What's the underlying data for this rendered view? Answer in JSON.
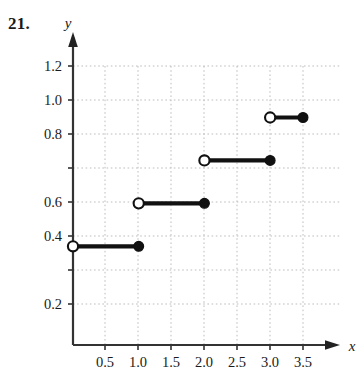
{
  "figure": {
    "problem_number": "21."
  },
  "chart_data": {
    "type": "line",
    "title": "",
    "subtitle": "",
    "xlabel": "x",
    "ylabel": "y",
    "grid": true,
    "legend": "none",
    "xlim": [
      0,
      3.75
    ],
    "ylim": [
      0,
      1.3
    ],
    "xticks": [
      0.5,
      1.0,
      1.5,
      2.0,
      2.5,
      3.0,
      3.5
    ],
    "xtick_labels": [
      "0.5",
      "1.0",
      "1.5",
      "2.0",
      "2.5",
      "3.0",
      "3.5"
    ],
    "yticks": [
      0.2,
      0.4,
      0.6,
      0.8,
      1.0,
      1.2
    ],
    "ytick_labels": [
      "0.2",
      "0.4",
      "0.6",
      "0.8",
      "1.0",
      "1.2"
    ],
    "segments": [
      {
        "x_start": 0.0,
        "x_end": 1.0,
        "y": 0.46,
        "left_endpoint": "open",
        "right_endpoint": "closed"
      },
      {
        "x_start": 1.0,
        "x_end": 2.0,
        "y": 0.66,
        "left_endpoint": "open",
        "right_endpoint": "closed"
      },
      {
        "x_start": 2.0,
        "x_end": 3.0,
        "y": 0.86,
        "left_endpoint": "open",
        "right_endpoint": "closed"
      },
      {
        "x_start": 3.0,
        "x_end": 3.5,
        "y": 1.06,
        "left_endpoint": "open",
        "right_endpoint": "closed"
      }
    ],
    "colors": {
      "line": "#111111",
      "grid": "#bdbdbd",
      "axis": "#333333",
      "marker_fill_closed": "#111111",
      "marker_fill_open": "#ffffff"
    }
  }
}
